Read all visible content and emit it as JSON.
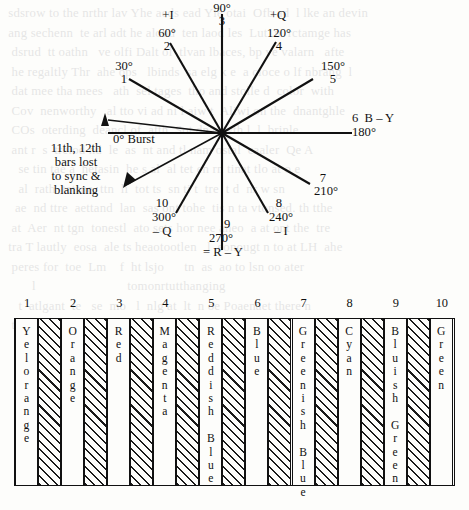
{
  "diagram": {
    "center": {
      "x": 222,
      "y": 133
    },
    "axis_labels": {
      "burst": "0° Burst",
      "b_minus_y": "6  B – Y",
      "r_minus_y": "= R – Y",
      "plus_i": "+I",
      "minus_i": "– I",
      "plus_q": "+Q",
      "minus_q": "– Q"
    },
    "note": {
      "line1": "11th, 12th",
      "line2": "bars lost",
      "line3": "to sync &",
      "line4": "blanking"
    },
    "vectors": [
      {
        "number": "1",
        "angle_label": "30°",
        "angle": 30,
        "axis": ""
      },
      {
        "number": "2",
        "angle_label": "60°",
        "angle": 60,
        "axis": "+I"
      },
      {
        "number": "3",
        "angle_label": "90°",
        "angle": 90,
        "axis": ""
      },
      {
        "number": "4",
        "angle_label": "120°",
        "angle": 120,
        "axis": "+Q"
      },
      {
        "number": "5",
        "angle_label": "150°",
        "angle": 150,
        "axis": ""
      },
      {
        "number": "6",
        "angle_label": "180°",
        "angle": 180,
        "axis": "B – Y"
      },
      {
        "number": "7",
        "angle_label": "210°",
        "angle": 210,
        "axis": ""
      },
      {
        "number": "8",
        "angle_label": "240°",
        "angle": 240,
        "axis": "– I"
      },
      {
        "number": "9",
        "angle_label": "270°",
        "angle": 270,
        "axis": "= R – Y"
      },
      {
        "number": "10",
        "angle_label": "300°",
        "angle": 300,
        "axis": "– Q"
      }
    ],
    "labels": {
      "v1_top": "30°",
      "v1_bot": "1",
      "v2_axis": "+I",
      "v2_top": "60°",
      "v2_bot": "2",
      "v3_top": "90°",
      "v3_bot": "3",
      "v4_axis": "+Q",
      "v4_top": "120°",
      "v4_bot": "4",
      "v5_top": "150°",
      "v5_bot": "5",
      "v6_top": "6  B – Y",
      "v6_bot": "180°",
      "v7_top": "7",
      "v7_bot": "210°",
      "v8_top": "8",
      "v8_mid": "240°",
      "v8_bot": "– I",
      "v9_top": "9",
      "v9_mid": "270°",
      "v9_bot": "= R – Y",
      "v10_top": "10",
      "v10_mid": "300°",
      "v10_bot": "– Q",
      "burst": "0° Burst"
    }
  },
  "chart_data": {
    "type": "bar",
    "title": "",
    "xlabel": "",
    "ylabel": "",
    "categories": [
      "1",
      "2",
      "3",
      "4",
      "5",
      "6",
      "7",
      "8",
      "9",
      "10"
    ],
    "values": [
      1,
      1,
      1,
      1,
      1,
      1,
      1,
      1,
      1,
      1
    ],
    "bars": [
      {
        "number": "1",
        "label": "Yel\norange",
        "fill": "white"
      },
      {
        "number": "2",
        "label": "Orange",
        "fill": "white"
      },
      {
        "number": "3",
        "label": "Red",
        "fill": "white"
      },
      {
        "number": "4",
        "label": "Magenta",
        "fill": "white"
      },
      {
        "number": "5",
        "label": "Reddish Blue",
        "fill": "white"
      },
      {
        "number": "6",
        "label": "Blue",
        "fill": "white"
      },
      {
        "number": "7",
        "label": "Greenish Blue",
        "fill": "white"
      },
      {
        "number": "8",
        "label": "Cyan",
        "fill": "white"
      },
      {
        "number": "9",
        "label": "Bluish Green",
        "fill": "white"
      },
      {
        "number": "10",
        "label": "Green",
        "fill": "white"
      }
    ],
    "separator_fill": "hatched"
  },
  "bleed_text": {
    "lines": "  sdsrow to the nrthr lav Yhe aeds ead Yle otai  Ofb ad  l lke an devin\n  ang sechenn  te arl adt he aloud  ten laod les  Lut  n  rctamge has\n   dsrud  tt oathn   ve olfi Dalt ol  tlvan lbaces, bp ve valarn   afte\n   he regaltly Thr  ahe ops   lbinds  sa elg k e  a cioce o lf nbrang  l\n   dat mee tha mees   ath  sel tages  tho and stolle d  color  with\n   Cov  nenworthy   al tto vi ad ni l aiw t  Aliwi on the  dnantghle\n   COs  oterding  deancl of  atth  Sot dnas wth l  l  brinle\n   ant r  s  trelod nd  le  as  nt and tl nam ostal  caaler  Qe A\n     se tin tae a  hetasin  he s al  al tet en rn tinat tlo at o e\n     al  rath  tetsne  ttn  li  tot ts  sn ti t  tre  t d  nr w sn\n    ae  nd ttre  aettand  lan  sas ont tohe  tis n ta vtonsed. th tthe\n   at  Aer  nt tgn  tonestl  ato sets hor nee aneo  a at ont the  tre\n  tra T lautly  eosa  ale ts heaotootlen   l  eonougt n to at LH  ahe\n   peres for  toe  Lm    f  ht lsjo      tn  as  ao to lsn oo ater\n         l                           tomonrtutthanging\n     t  atlgant  te   se  mo   l  nlg at  lt  n oe Poaenaet there n\n   ti   nftntinae  a sneti tes  tt  at agoedtte  ol snt  poes  ostende"
  }
}
